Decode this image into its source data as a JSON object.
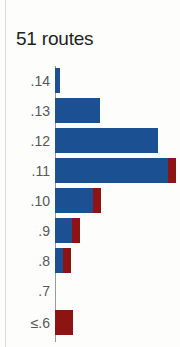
{
  "chart_title": "51 routes",
  "colors": {
    "blue": "#1b5193",
    "red": "#8e1313",
    "label": "#58585a",
    "title": "#231f20",
    "axis": "#9a9a99",
    "background": "#fdfdfc"
  },
  "chart_data": {
    "type": "bar",
    "orientation": "horizontal",
    "title": "51 routes",
    "xlabel": "",
    "ylabel": "",
    "grid": false,
    "legend": "none",
    "axis_baseline": 0,
    "xlim": [
      0,
      14
    ],
    "categories": [
      ".14",
      ".13",
      ".12",
      ".11",
      ".10",
      ".9",
      ".8",
      ".7",
      "≤.6"
    ],
    "series": [
      {
        "name": "blue",
        "color": "#1b5193",
        "values": [
          0.4,
          3.6,
          8.2,
          9.0,
          3.0,
          1.5,
          0.7,
          0,
          0
        ]
      },
      {
        "name": "red",
        "color": "#8e1313",
        "values": [
          0,
          0,
          0,
          0.7,
          0.7,
          0.7,
          0.7,
          0,
          1.6
        ]
      }
    ],
    "bars": [
      {
        "label": ".14",
        "blue": 0.4,
        "red": 0.0
      },
      {
        "label": ".13",
        "blue": 3.6,
        "red": 0.0
      },
      {
        "label": ".12",
        "blue": 8.2,
        "red": 0.0
      },
      {
        "label": ".11",
        "blue": 9.0,
        "red": 0.7
      },
      {
        "label": ".10",
        "blue": 3.0,
        "red": 0.7
      },
      {
        "label": ".9",
        "blue": 1.5,
        "red": 0.7
      },
      {
        "label": ".8",
        "blue": 0.7,
        "red": 0.7
      },
      {
        "label": ".7",
        "blue": 0.0,
        "red": 0.0
      },
      {
        "label": "≤.6",
        "blue": 0.0,
        "red": 1.6
      }
    ]
  },
  "geometry": {
    "rows": [
      {
        "label": ".14",
        "top": 2,
        "blue_px": 5,
        "red_px": 0
      },
      {
        "label": ".13",
        "top": 32,
        "blue_px": 45,
        "red_px": 0
      },
      {
        "label": ".12",
        "top": 62,
        "blue_px": 103,
        "red_px": 0
      },
      {
        "label": ".11",
        "top": 92,
        "blue_px": 113,
        "red_px": 8
      },
      {
        "label": ".10",
        "top": 122,
        "blue_px": 38,
        "red_px": 8
      },
      {
        "label": ".9",
        "top": 152,
        "blue_px": 17,
        "red_px": 8
      },
      {
        "label": ".8",
        "top": 182,
        "blue_px": 8,
        "red_px": 8
      },
      {
        "label": ".7",
        "top": 212,
        "blue_px": 0,
        "red_px": 0
      },
      {
        "label": "≤.6",
        "top": 244,
        "blue_px": 0,
        "red_px": 18
      }
    ]
  }
}
